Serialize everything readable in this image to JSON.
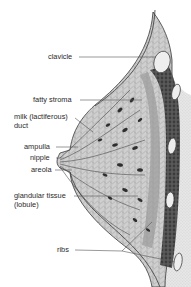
{
  "diagram": {
    "labels": [
      {
        "id": "clavicle",
        "text": "clavicle"
      },
      {
        "id": "fatty_stroma",
        "text": "fatty stroma"
      },
      {
        "id": "milk_duct_line1",
        "text": "milk (lactiferous)"
      },
      {
        "id": "milk_duct_line2",
        "text": "duct"
      },
      {
        "id": "ampulla",
        "text": "ampulla"
      },
      {
        "id": "nipple",
        "text": "nipple"
      },
      {
        "id": "areola",
        "text": "areola"
      },
      {
        "id": "glandular_line1",
        "text": "glandular tissue"
      },
      {
        "id": "glandular_line2",
        "text": "(lobule)"
      },
      {
        "id": "ribs",
        "text": "ribs"
      }
    ],
    "colors": {
      "outline": "#3a3a3a",
      "fat_fill": "#c9c9c9",
      "chest_fill": "#e4e4e4",
      "muscle_fill": "#4a4a4a",
      "lobule_fill": "#2e2e2e",
      "rib_fill": "#eeeeee",
      "leader_line": "#555555"
    }
  }
}
